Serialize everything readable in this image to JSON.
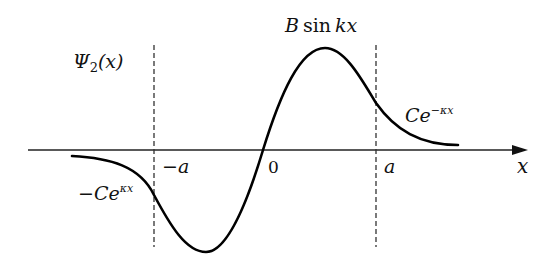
{
  "figure": {
    "function_label": {
      "main": "Ψ",
      "sub": "2",
      "arg": "(x)"
    },
    "axis": {
      "x_label": "x"
    },
    "ticks": [
      {
        "label": "−a",
        "position": "-a"
      },
      {
        "label": "0",
        "position": "0"
      },
      {
        "label": "a",
        "position": "a"
      }
    ],
    "region_labels": {
      "left": {
        "prefix": "−C",
        "base": "e",
        "exponent": "κx"
      },
      "middle": {
        "coef": "B",
        "func": "sin",
        "arg": "kx"
      },
      "right": {
        "prefix": "C",
        "base": "e",
        "exponent": "−κx"
      }
    },
    "boundaries": [
      "-a",
      "a"
    ],
    "colors": {
      "curve": "#000000",
      "axis": "#222222",
      "dashed": "#333333",
      "background": "#ffffff"
    }
  }
}
